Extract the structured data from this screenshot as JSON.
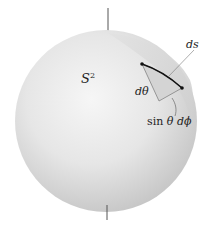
{
  "figure": {
    "type": "sphere-surface-element-diagram",
    "labels": {
      "sphere": "S",
      "sphere_exponent": "2",
      "arc_length": "ds",
      "polar_element": "dθ",
      "azimuthal_element_prefix": "sin",
      "azimuthal_element_theta": "θ",
      "azimuthal_element_suffix": "dϕ"
    },
    "colors": {
      "background": "#ffffff",
      "sphere_light": "#f4f4f4",
      "sphere_dark": "#c9c9c9",
      "patch": "#d8d8d8",
      "ink": "#222222"
    }
  }
}
